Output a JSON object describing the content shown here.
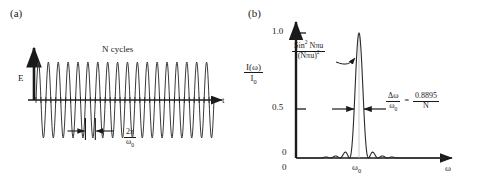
{
  "figure": {
    "background": "#ffffff",
    "ink": "#1a1a1a",
    "panels": [
      {
        "id": "a",
        "label": "(a)"
      },
      {
        "id": "b",
        "label": "(b)"
      }
    ]
  },
  "panel_a": {
    "label": "(a)",
    "y_axis_label": "E",
    "x_axis_label": "t",
    "title_annotation": "N cycles",
    "period_annotation": {
      "numerator": "2π",
      "denominator": "ω",
      "denominator_sub": "0"
    }
  },
  "panel_b": {
    "label": "(b)",
    "y_axis_label": {
      "numerator": "I(ω)",
      "denominator": "I",
      "denominator_sub": "0"
    },
    "x_axis_label": "ω",
    "origin_label": "0",
    "y_ticks": [
      "1.0",
      "0.5",
      "0"
    ],
    "x_tick_label": "ω",
    "x_tick_label_sub": "0",
    "formula_annotation": {
      "numerator_pre": "Sin",
      "numerator_sup": "2",
      "numerator_post": " Nπu",
      "denominator": "(Nπu)",
      "denominator_sup": "2"
    },
    "width_annotation": {
      "left_numerator": "Δω",
      "left_denominator": "ω",
      "left_denominator_sub": "0",
      "equals": "=",
      "right_numerator": "0.8895",
      "right_denominator": "N"
    }
  },
  "chart_data": [
    {
      "id": "panel_a",
      "type": "line",
      "title": "N cycles",
      "xlabel": "t",
      "ylabel": "E",
      "description": "Finite wave train: sinusoidal oscillation E(t) of constant amplitude lasting N cycles",
      "n_cycles": 18,
      "amplitude": 1.0,
      "xlim": [
        0,
        18
      ],
      "ylim": [
        -1.15,
        1.15
      ],
      "grid": false,
      "legend": false,
      "period_marker": {
        "label": "2π/ω₀",
        "cycle_index_start": 5,
        "cycle_index_end": 6
      }
    },
    {
      "id": "panel_b",
      "type": "line",
      "title": "",
      "xlabel": "ω",
      "ylabel": "I(ω)/I₀",
      "description": "Spectral intensity distribution of a finite wave train: sinc-squared function Sin²(Nπu)/(Nπu)² peaked at ω₀",
      "function": "sin^2(N*pi*u)/(N*pi*u)^2",
      "N": 18,
      "peak_center": "ω₀",
      "peak_value": 1.0,
      "xlim": [
        0,
        1
      ],
      "ylim": [
        0,
        1.05
      ],
      "y_ticks": [
        0,
        0.5,
        1.0
      ],
      "y_tick_labels": [
        "0",
        "0.5",
        "1.0"
      ],
      "x_ticks": [
        "ω₀"
      ],
      "grid": false,
      "legend": false,
      "fwhm_label": "Δω/ω₀ = 0.8895/N",
      "fwhm_value": 0.8895,
      "side_lobes_per_side": 3
    }
  ]
}
